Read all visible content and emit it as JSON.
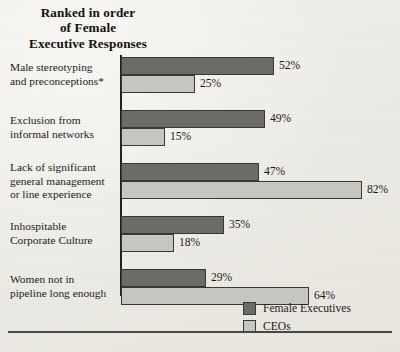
{
  "chart_data": {
    "type": "bar",
    "orientation": "horizontal",
    "title": "Ranked in order of Female Executive Responses",
    "title_lines": [
      "Ranked in order",
      "of Female",
      "Executive Responses"
    ],
    "xlabel": "",
    "ylabel": "",
    "xlim": [
      0,
      100
    ],
    "grid": false,
    "legend_position": "bottom-right",
    "value_suffix": "%",
    "categories": [
      "Male stereotyping and preconceptions*",
      "Exclusion from informal networks",
      "Lack of significant general management or line experience",
      "Inhospitable Corporate Culture",
      "Women not in pipeline long enough"
    ],
    "category_lines": [
      [
        "Male stereotyping",
        "and preconceptions*"
      ],
      [
        "Exclusion from",
        "informal networks"
      ],
      [
        "Lack of significant",
        "general management",
        "or line experience"
      ],
      [
        "Inhospitable",
        "Corporate Culture"
      ],
      [
        "Women not in",
        "pipeline long enough"
      ]
    ],
    "series": [
      {
        "name": "Female Executives",
        "color": "#6e6c69",
        "values": [
          52,
          49,
          47,
          35,
          29
        ],
        "labels": [
          "52%",
          "49%",
          "47%",
          "35%",
          "29%"
        ]
      },
      {
        "name": "CEOs",
        "color": "#c9c7c2",
        "values": [
          25,
          15,
          82,
          18,
          64
        ],
        "labels": [
          "25%",
          "15%",
          "82%",
          "18%",
          "64%"
        ]
      }
    ]
  },
  "legend": {
    "items": [
      {
        "label": "Female Executives",
        "color": "#6e6c69"
      },
      {
        "label": "CEOs",
        "color": "#c9c7c2"
      }
    ]
  },
  "layout": {
    "axis_x": 121,
    "px_per_percent": 2.94,
    "bar_height": 18,
    "group_tops": [
      57,
      110,
      163,
      216,
      269
    ]
  }
}
